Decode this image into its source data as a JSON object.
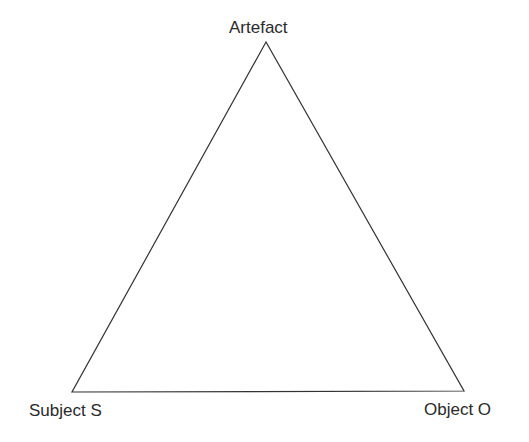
{
  "diagram": {
    "type": "triangle",
    "vertices": {
      "top": {
        "label": "Artefact"
      },
      "bottom_left": {
        "label": "Subject S"
      },
      "bottom_right": {
        "label": "Object O"
      }
    },
    "line_color": "#333333"
  }
}
